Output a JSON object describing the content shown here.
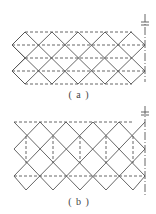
{
  "figures": [
    {
      "id": "a",
      "caption": "( a )",
      "description": "Diamond lattice with horizontal dashed lines through vertex rows",
      "lattice": {
        "x_start": 12,
        "cell_width": 26.6,
        "columns": 5,
        "rows_y": [
          32,
          45,
          58,
          71,
          84
        ],
        "dashed_horizontal_y": [
          32,
          45,
          58,
          71,
          84
        ],
        "axis_x": 145
      }
    },
    {
      "id": "b",
      "caption": "( b )",
      "description": "Diamond lattice with vertical dashed lines and top/bottom dashed horizontals",
      "lattice": {
        "x_start": 12,
        "cell_width": 26.6,
        "columns": 5,
        "rows_y": [
          122,
          136,
          149,
          163,
          176,
          190
        ],
        "dashed_horizontal_y": [
          122,
          176
        ],
        "dashed_vertical_x": [
          26,
          53,
          80,
          106,
          133
        ],
        "axis_x": 145
      }
    }
  ],
  "colors": {
    "line": "#555555",
    "dashed": "#555555",
    "background": "#ffffff"
  }
}
